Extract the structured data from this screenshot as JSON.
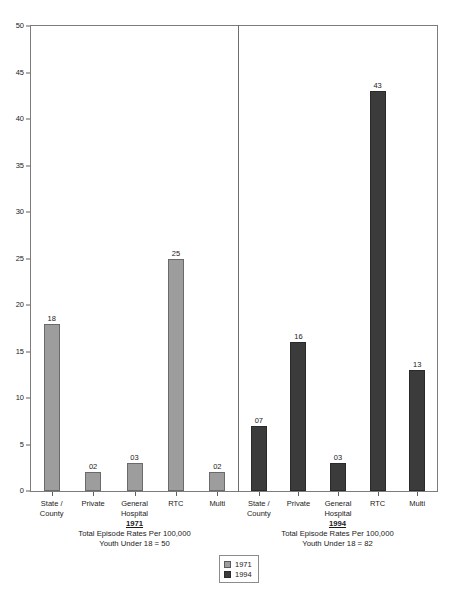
{
  "chart_data": {
    "type": "bar",
    "title": "",
    "xlabel": "",
    "ylabel": "",
    "ylim": [
      0,
      50
    ],
    "yticks": [
      0,
      5,
      10,
      15,
      20,
      25,
      30,
      35,
      40,
      45,
      50
    ],
    "grid": false,
    "legend_position": "bottom-center",
    "categories": [
      "State /\nCounty",
      "Private",
      "General\nHospital",
      "RTC",
      "Multi"
    ],
    "category_labels": [
      [
        "State /",
        "County"
      ],
      [
        "Private",
        ""
      ],
      [
        "General",
        "Hospital"
      ],
      [
        "RTC",
        ""
      ],
      [
        "Multi",
        ""
      ]
    ],
    "series": [
      {
        "name": "1971",
        "color": "#9d9d9d",
        "values": [
          18,
          2,
          3,
          25,
          2
        ],
        "value_labels": [
          "18",
          "02",
          "03",
          "25",
          "02"
        ]
      },
      {
        "name": "1994",
        "color": "#3b3b3b",
        "values": [
          7,
          16,
          3,
          43,
          13
        ],
        "value_labels": [
          "07",
          "16",
          "03",
          "43",
          "13"
        ]
      }
    ],
    "panels": [
      {
        "year": "1971",
        "caption_line1": "Total Episode Rates Per 100,000",
        "caption_line2": "Youth Under 18 = 50"
      },
      {
        "year": "1994",
        "caption_line1": "Total Episode Rates Per 100,000",
        "caption_line2": "Youth Under 18 = 82"
      }
    ],
    "legend": [
      {
        "label": "1971",
        "color": "#9d9d9d"
      },
      {
        "label": "1994",
        "color": "#3b3b3b"
      }
    ]
  }
}
